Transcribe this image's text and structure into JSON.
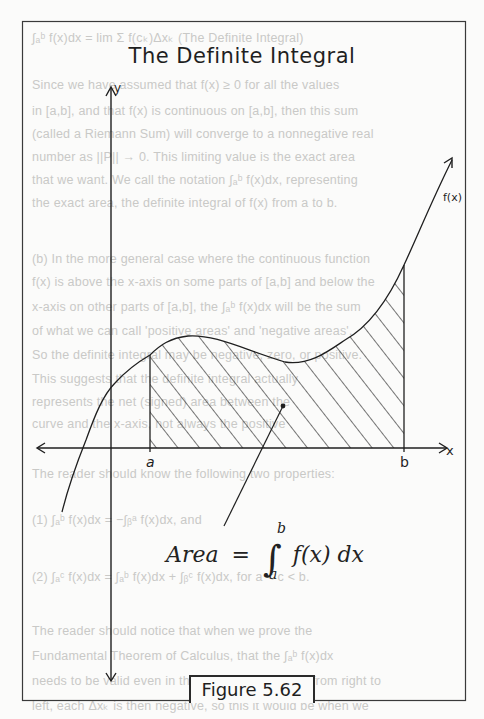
{
  "figure": {
    "title": "The Definite Integral",
    "caption": "Figure 5.62",
    "axes": {
      "x_label": "x",
      "y_label": "y",
      "a_label": "a",
      "b_label": "b"
    },
    "curve_label": "f(x)",
    "formula": {
      "lhs": "Area",
      "equals": "=",
      "integral_symbol": "∫",
      "upper_limit": "b",
      "lower_limit": "a",
      "integrand": "f(x) dx"
    },
    "colors": {
      "ink": "#1f1f1f",
      "paper": "#fbfbfa",
      "bleed_text": "#c9c9c7"
    }
  },
  "bleed_through_text": [
    "∫ₐᵇ f(x)dx = lim Σ f(cₖ)Δxₖ  (The Definite Integral)",
    "Since we have assumed that f(x) ≥ 0 for all the values",
    "in [a,b], and that f(x) is continuous on [a,b], then this sum",
    "(called a Riemann Sum) will converge to a nonnegative real",
    "number as ||P|| → 0. This limiting value is the exact area",
    "that we want. We call the notation ∫ₐᵇ f(x)dx, representing",
    "the exact area, the definite integral of f(x) from a to b.",
    "(b) In the more general case where the continuous function",
    "f(x) is above the x-axis on some parts of [a,b] and below the",
    "x-axis on other parts of [a,b], the ∫ₐᵇ f(x)dx will be the sum",
    "of what we can call 'positive areas' and 'negative areas'.",
    "So the definite integral may be negative, zero, or positive.",
    "This suggests that the definite integral actually",
    "represents the net (signed) area between the",
    "curve and the x-axis, not always the positive",
    "The reader should know the following two properties:",
    "(1) ∫ₐᵇ f(x)dx = −∫ᵦᵃ f(x)dx, and",
    "(2) ∫ₐᶜ f(x)dx = ∫ₐᵇ f(x)dx + ∫ᵦᶜ f(x)dx, for a < c < b.",
    "The reader should notice that when we prove the",
    "Fundamental Theorem of Calculus, that the ∫ₐᵇ f(x)dx",
    "needs to be valid even in the case that we move from right to",
    "left, each Δxₖ is then negative, so this it would be when we"
  ]
}
